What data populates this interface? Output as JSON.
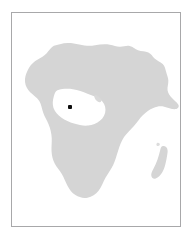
{
  "figure": {
    "kind": "locator-map",
    "region_label": "Africa",
    "width_px": 193,
    "height_px": 243,
    "background_color": "#ffffff"
  },
  "frame": {
    "border_color": "#a8a8aa",
    "border_width_px": 1,
    "fill_color": "#ffffff",
    "left_px": 11,
    "top_px": 12,
    "width_px": 170,
    "height_px": 215
  },
  "landmass": {
    "name": "africa-continent",
    "fill_color": "#d5d5d5",
    "ocean_color": "#ffffff",
    "islands": [
      {
        "name": "madagascar",
        "fill_color": "#d5d5d5"
      },
      {
        "name": "gulf-of-guinea-islet",
        "fill_color": "#d9d9d9"
      }
    ]
  },
  "markers": [
    {
      "name": "location-marker",
      "shape": "square",
      "color": "#0d0d0d",
      "size_px": 4,
      "x_px": 69,
      "y_px": 106
    }
  ],
  "labels": {
    "title": "",
    "caption": "",
    "legend": ""
  }
}
